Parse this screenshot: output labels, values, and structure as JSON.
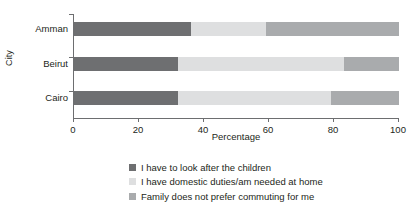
{
  "chart_data": {
    "type": "bar",
    "orientation": "horizontal",
    "stacked": true,
    "stack_mode": "percent",
    "title": "",
    "xlabel": "Percentage",
    "ylabel": "City",
    "categories": [
      "Amman",
      "Beirut",
      "Cairo"
    ],
    "xlim": [
      0,
      100
    ],
    "xticks": [
      0,
      20,
      40,
      60,
      80,
      100
    ],
    "xtick_labels": [
      "0",
      "20",
      "40",
      "60",
      "80",
      "100"
    ],
    "grid": false,
    "legend_position": "bottom",
    "series": [
      {
        "name": "I have to look after the children",
        "color": "#6e6f71",
        "values": [
          36,
          32,
          32
        ]
      },
      {
        "name": "I have domestic duties/am needed at home",
        "color": "#dedfe0",
        "values": [
          23,
          51,
          47
        ]
      },
      {
        "name": "Family does not prefer commuting for me",
        "color": "#a9abad",
        "values": [
          41,
          17,
          21
        ]
      }
    ],
    "segment_boundaries": {
      "Amman": [
        36,
        59,
        100
      ],
      "Beirut": [
        32,
        83,
        100
      ],
      "Cairo": [
        32,
        79,
        100
      ]
    }
  },
  "axes": {
    "x_title": "Percentage",
    "y_title": "City",
    "x_tick_0": "0",
    "x_tick_1": "20",
    "x_tick_2": "40",
    "x_tick_3": "60",
    "x_tick_4": "80",
    "x_tick_5": "100",
    "cat_0": "Amman",
    "cat_1": "Beirut",
    "cat_2": "Cairo"
  },
  "legend": {
    "items": [
      {
        "label": "I have to look after the children",
        "color": "#6e6f71"
      },
      {
        "label": "I have domestic duties/am needed at home",
        "color": "#dedfe0"
      },
      {
        "label": "Family does not prefer commuting for me",
        "color": "#a9abad"
      }
    ]
  }
}
